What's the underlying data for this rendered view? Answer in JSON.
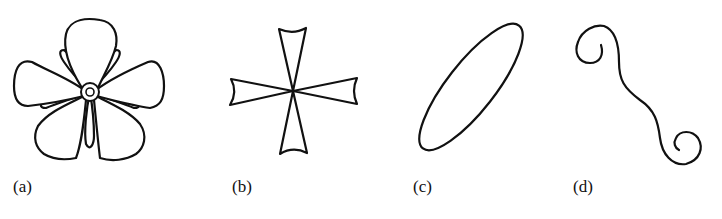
{
  "figure": {
    "panels": [
      {
        "id": "a",
        "label": "(a)",
        "shape": "five-petal-flower"
      },
      {
        "id": "b",
        "label": "(b)",
        "shape": "maltese-cross"
      },
      {
        "id": "c",
        "label": "(c)",
        "shape": "tilted-ellipse"
      },
      {
        "id": "d",
        "label": "(d)",
        "shape": "s-curve-with-spiral-ends"
      }
    ],
    "colors": {
      "line": "#111111",
      "background": "#ffffff"
    }
  }
}
